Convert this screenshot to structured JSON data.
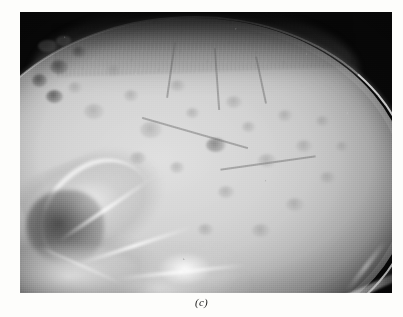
{
  "figure": {
    "caption": "(c)",
    "media_type": "radiograph",
    "view": "lateral skull X-ray",
    "page_background": "#fdfdfb",
    "plate": {
      "background": "#080808",
      "left": 20,
      "top": 12,
      "width": 372,
      "height": 281
    },
    "palette": {
      "film_background": "#080808",
      "calvarium_light": "#d9d9d9",
      "calvarium_mid": "#c2c2c2",
      "calvarium_shadow": "#8c8c8c",
      "bone_highlight": "#fafafa",
      "lesion_dark": "#5f5f5f",
      "caption_color": "#1a1a1a"
    },
    "regions": [
      {
        "name": "cranial-vault",
        "description": "large rounded calvarium occupying most of the film"
      },
      {
        "name": "scalp-soft-tissue",
        "description": "dark hair and scalp haze over the vertex"
      },
      {
        "name": "facial-skeleton",
        "description": "bright bony structures at the anterior-inferior left"
      },
      {
        "name": "skull-base",
        "description": "dense bright petrous and basal bone along the bottom"
      },
      {
        "name": "lytic-lesions",
        "description": "multiple small rounded radiolucent punched-out defects in the calvarium"
      }
    ],
    "lesions": [
      {
        "x": 18,
        "y": 28,
        "w": 20,
        "h": 12,
        "tone": "deep"
      },
      {
        "x": 36,
        "y": 24,
        "w": 16,
        "h": 10,
        "tone": "deep"
      },
      {
        "x": 52,
        "y": 34,
        "w": 14,
        "h": 11,
        "tone": "deep"
      },
      {
        "x": 30,
        "y": 48,
        "w": 18,
        "h": 14,
        "tone": "deep"
      },
      {
        "x": 12,
        "y": 62,
        "w": 15,
        "h": 13,
        "tone": "deep"
      },
      {
        "x": 26,
        "y": 78,
        "w": 17,
        "h": 13,
        "tone": "deep"
      },
      {
        "x": 48,
        "y": 70,
        "w": 14,
        "h": 11,
        "tone": "faint"
      },
      {
        "x": 64,
        "y": 92,
        "w": 20,
        "h": 15,
        "tone": "faint"
      },
      {
        "x": 86,
        "y": 52,
        "w": 16,
        "h": 12,
        "tone": "faint"
      },
      {
        "x": 104,
        "y": 78,
        "w": 14,
        "h": 11,
        "tone": "faint"
      },
      {
        "x": 120,
        "y": 110,
        "w": 22,
        "h": 16,
        "tone": "faint"
      },
      {
        "x": 150,
        "y": 68,
        "w": 15,
        "h": 11,
        "tone": "faint"
      },
      {
        "x": 166,
        "y": 96,
        "w": 13,
        "h": 10,
        "tone": "faint"
      },
      {
        "x": 186,
        "y": 126,
        "w": 20,
        "h": 14,
        "tone": "normal"
      },
      {
        "x": 206,
        "y": 84,
        "w": 16,
        "h": 12,
        "tone": "faint"
      },
      {
        "x": 222,
        "y": 110,
        "w": 13,
        "h": 10,
        "tone": "faint"
      },
      {
        "x": 238,
        "y": 142,
        "w": 18,
        "h": 13,
        "tone": "faint"
      },
      {
        "x": 258,
        "y": 98,
        "w": 14,
        "h": 11,
        "tone": "faint"
      },
      {
        "x": 276,
        "y": 128,
        "w": 16,
        "h": 12,
        "tone": "faint"
      },
      {
        "x": 296,
        "y": 104,
        "w": 13,
        "h": 10,
        "tone": "faint"
      },
      {
        "x": 300,
        "y": 160,
        "w": 15,
        "h": 11,
        "tone": "faint"
      },
      {
        "x": 266,
        "y": 186,
        "w": 18,
        "h": 13,
        "tone": "faint"
      },
      {
        "x": 198,
        "y": 174,
        "w": 16,
        "h": 12,
        "tone": "faint"
      },
      {
        "x": 150,
        "y": 150,
        "w": 14,
        "h": 11,
        "tone": "faint"
      },
      {
        "x": 110,
        "y": 140,
        "w": 16,
        "h": 12,
        "tone": "faint"
      },
      {
        "x": 232,
        "y": 212,
        "w": 18,
        "h": 13,
        "tone": "faint"
      },
      {
        "x": 178,
        "y": 212,
        "w": 15,
        "h": 11,
        "tone": "faint"
      },
      {
        "x": 316,
        "y": 130,
        "w": 12,
        "h": 9,
        "tone": "faint"
      }
    ],
    "grooves": [
      {
        "x": 150,
        "y": 30,
        "w": 2,
        "h": 56,
        "rot": 8
      },
      {
        "x": 196,
        "y": 36,
        "w": 2,
        "h": 62,
        "rot": -4
      },
      {
        "x": 240,
        "y": 44,
        "w": 2,
        "h": 48,
        "rot": -12
      },
      {
        "x": 120,
        "y": 120,
        "w": 110,
        "h": 2,
        "rot": 16
      },
      {
        "x": 200,
        "y": 150,
        "w": 96,
        "h": 2,
        "rot": -8
      }
    ],
    "ridges": [
      {
        "x": 30,
        "y": 196,
        "w": 110,
        "h": 4,
        "rot": -34
      },
      {
        "x": 54,
        "y": 232,
        "w": 120,
        "h": 4,
        "rot": -18
      },
      {
        "x": 96,
        "y": 258,
        "w": 130,
        "h": 4,
        "rot": -6
      },
      {
        "x": 16,
        "y": 252,
        "w": 90,
        "h": 3,
        "rot": 24
      }
    ]
  }
}
